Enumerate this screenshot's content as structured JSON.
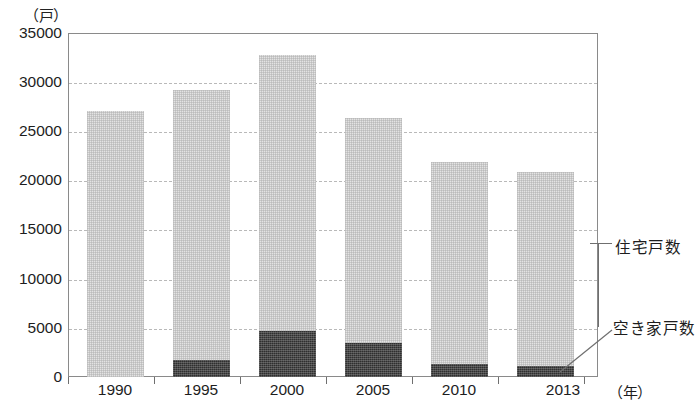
{
  "chart_data": {
    "type": "bar",
    "stacked": true,
    "title": "",
    "xlabel": "年",
    "ylabel": "戸",
    "y_unit_caption": "（戸）",
    "x_unit_caption": "（年）",
    "categories": [
      "1990",
      "1995",
      "2000",
      "2005",
      "2010",
      "2013"
    ],
    "ylim": [
      0,
      35000
    ],
    "ytick_values": [
      0,
      5000,
      10000,
      15000,
      20000,
      25000,
      30000,
      35000
    ],
    "ytick_labels": [
      "0",
      "5000",
      "10000",
      "15000",
      "20000",
      "25000",
      "30000",
      "35000"
    ],
    "grid": true,
    "grid_style": "dotted-horizontal",
    "legend_position": "right-callout",
    "series": [
      {
        "name": "住宅戸数",
        "role": "total",
        "color": "#e3e3e3",
        "values": [
          27100,
          29200,
          32800,
          26400,
          21900,
          20900
        ]
      },
      {
        "name": "空き家戸数",
        "role": "vacant",
        "color": "#2f2f2f",
        "values": [
          0,
          1700,
          4700,
          3500,
          1300,
          1100
        ]
      }
    ],
    "annotations": [
      {
        "text": "住宅戸数",
        "target_category": "2013"
      },
      {
        "text": "空き家戸数",
        "target_category": "2013"
      }
    ]
  },
  "axis": {
    "y_unit": "（戸）",
    "x_unit": "（年）",
    "y_ticks": [
      "35000",
      "30000",
      "25000",
      "20000",
      "15000",
      "10000",
      "5000",
      "0"
    ],
    "x_ticks": [
      "1990",
      "1995",
      "2000",
      "2005",
      "2010",
      "2013"
    ]
  },
  "legend": {
    "total_label": "住宅戸数",
    "vacant_label": "空き家戸数"
  },
  "colors": {
    "total_fill": "#e3e3e3",
    "vacant_fill": "#2f2f2f",
    "frame": "#8a8a8a",
    "gridline": "#b9b9b9",
    "text": "#1d1d1d"
  }
}
